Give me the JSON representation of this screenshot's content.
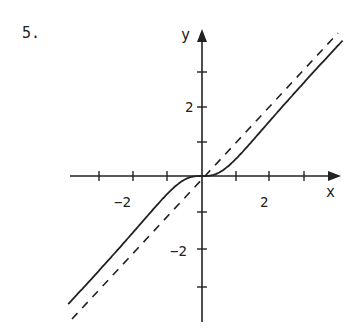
{
  "problem_number": "5.",
  "chart_data": {
    "type": "line",
    "title": "",
    "xlabel": "x",
    "ylabel": "y",
    "xlim": [
      -3.9,
      4.0
    ],
    "ylim": [
      -4.2,
      4.2
    ],
    "grid": false,
    "x_ticks": [
      -3,
      -2,
      -1,
      1,
      2,
      3
    ],
    "x_tick_labels": [
      "-2",
      "2"
    ],
    "y_ticks": [
      -3,
      -2,
      -1,
      1,
      2,
      3
    ],
    "y_tick_labels": [
      "2",
      "-2"
    ],
    "series": [
      {
        "name": "curve",
        "style": "solid",
        "formula": "y = x^3/(x^2+1)",
        "x": [
          -3.9,
          -3,
          -2,
          -1.5,
          -1,
          -0.5,
          0,
          0.5,
          1,
          1.5,
          2,
          3,
          4.1
        ],
        "y": [
          -3.66,
          -2.7,
          -1.6,
          -1.04,
          -0.5,
          -0.1,
          0,
          0.1,
          0.5,
          1.04,
          1.6,
          2.7,
          3.86
        ]
      },
      {
        "name": "asymptote",
        "style": "dashed",
        "formula": "y = x",
        "x": [
          -3.8,
          3.9
        ],
        "y": [
          -3.8,
          3.9
        ]
      }
    ],
    "annotations": [
      "5."
    ]
  },
  "labels": {
    "x_axis": "x",
    "y_axis": "y",
    "x_neg2": "−2",
    "x_pos2": "2",
    "y_pos2": "2",
    "y_neg2": "−2"
  }
}
